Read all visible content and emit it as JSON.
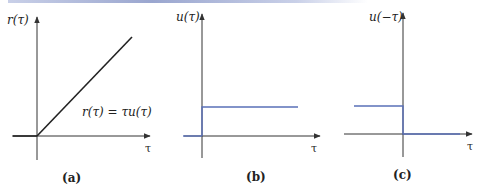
{
  "figure": {
    "panels": [
      {
        "id": "a",
        "caption": "(a)",
        "y_label": "r(τ)",
        "x_label": "τ",
        "equation": "r(τ) = τu(τ)",
        "function": "ramp",
        "description": "Ramp function: zero for τ<0, rising linearly for τ≥0"
      },
      {
        "id": "b",
        "caption": "(b)",
        "y_label": "u(τ)",
        "x_label": "τ",
        "function": "unit step",
        "description": "Unit step: 0 for τ<0, 1 for τ≥0"
      },
      {
        "id": "c",
        "caption": "(c)",
        "y_label": "u(−τ)",
        "x_label": "τ",
        "function": "time-reversed unit step",
        "description": "Reflected step: 1 for τ≤0, 0 for τ>0"
      }
    ],
    "colors": {
      "axis": "#333333",
      "ramp": "#222222",
      "step": "#5a70b8",
      "top_bar": "#9aa6cf"
    }
  }
}
